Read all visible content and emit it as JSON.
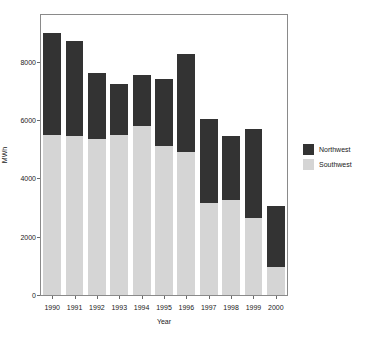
{
  "chart_data": {
    "type": "bar",
    "stacked": true,
    "title": "",
    "subtitle": "",
    "xlabel": "Year",
    "ylabel": "MWh",
    "categories": [
      "1990",
      "1991",
      "1992",
      "1993",
      "1994",
      "1995",
      "1996",
      "1997",
      "1998",
      "1999",
      "2000"
    ],
    "series": [
      {
        "name": "Southwest",
        "color": "#d5d5d5",
        "values": [
          5500,
          5450,
          5350,
          5500,
          5800,
          5100,
          4900,
          3150,
          3250,
          2650,
          950
        ]
      },
      {
        "name": "Northwest",
        "color": "#333333",
        "values": [
          3500,
          3250,
          2250,
          1750,
          1750,
          2300,
          3350,
          2900,
          2200,
          3050,
          2100
        ]
      }
    ],
    "totals": [
      9000,
      8700,
      7600,
      7250,
      7550,
      7400,
      8250,
      6050,
      5450,
      5700,
      3050
    ],
    "yticks": [
      0,
      2000,
      4000,
      6000,
      8000
    ],
    "ylim": [
      0,
      9600
    ],
    "xtick_labels": [
      "1990",
      "1991",
      "1992",
      "1993",
      "1994",
      "1995",
      "1996",
      "1997",
      "1998",
      "1999",
      "2000"
    ],
    "grid": false,
    "legend_position": "right",
    "legend": [
      {
        "label": "Northwest",
        "color": "#333333"
      },
      {
        "label": "Southwest",
        "color": "#d5d5d5"
      }
    ]
  }
}
